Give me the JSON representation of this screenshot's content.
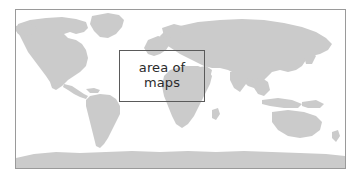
{
  "figure": {
    "type": "world-locator-map",
    "projection": "equirectangular",
    "ocean_color": "#ffffff",
    "land_color": "#cbcbcb",
    "frame_color": "#9a9a9a",
    "inset_border_color": "#5a5a5a",
    "label_color": "#2b2b2b"
  },
  "inset": {
    "label": "area of\nmaps",
    "label_line_1": "area of",
    "label_line_2": "maps"
  },
  "landmasses": [
    "north-america",
    "greenland",
    "south-america",
    "eurasia",
    "africa",
    "australia",
    "indonesia",
    "antarctica"
  ]
}
